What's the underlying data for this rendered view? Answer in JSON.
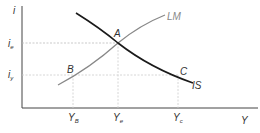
{
  "diagram": {
    "type": "IS-LM",
    "axes": {
      "y_label": "i",
      "x_label": "Y"
    },
    "curves": [
      {
        "name": "IS",
        "label": "IS",
        "color": "#1a1a1a"
      },
      {
        "name": "LM",
        "label": "LM",
        "color": "#888888"
      }
    ],
    "points": [
      {
        "label": "A"
      },
      {
        "label": "B"
      },
      {
        "label": "C"
      }
    ],
    "y_ticks": [
      {
        "main": "i",
        "sub": "e"
      },
      {
        "main": "i",
        "sub": "y"
      }
    ],
    "x_ticks": [
      {
        "main": "Y",
        "sub": "B"
      },
      {
        "main": "Y",
        "sub": "e"
      },
      {
        "main": "Y",
        "sub": "c"
      }
    ]
  }
}
